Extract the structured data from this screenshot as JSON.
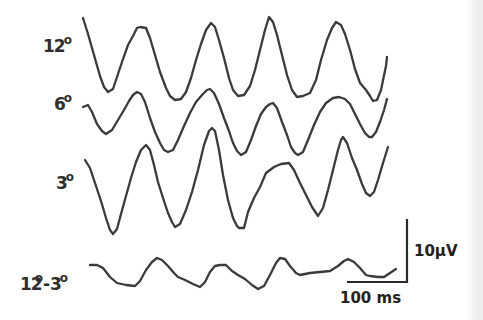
{
  "labels": {
    "trace_12": {
      "value": "12",
      "unit": "o"
    },
    "trace_6": {
      "value": "6",
      "unit": "o"
    },
    "trace_3": {
      "value": "3",
      "unit": "o"
    },
    "trace_diff": {
      "a": "12",
      "a_unit": "o",
      "sep": "-",
      "b": "3",
      "b_unit": "o"
    }
  },
  "scale_bar": {
    "amplitude_label": "10µV",
    "time_label": "100 ms"
  },
  "colors": {
    "trace": "#3a3a3a",
    "text": "#2e2e2e",
    "background": "#ffffff"
  },
  "chart_data": {
    "type": "line",
    "title": "",
    "xlabel": "",
    "ylabel": "",
    "scale": {
      "vertical": "10 µV",
      "horizontal": "100 ms"
    },
    "grid": false,
    "legend": "inline labels at left of each trace",
    "series": [
      {
        "name": "12°",
        "points": [
          [
            83,
            18
          ],
          [
            88,
            34
          ],
          [
            94,
            55
          ],
          [
            100,
            76
          ],
          [
            104,
            87
          ],
          [
            108,
            92
          ],
          [
            113,
            89
          ],
          [
            117,
            77
          ],
          [
            122,
            62
          ],
          [
            128,
            45
          ],
          [
            133,
            36
          ],
          [
            137,
            28
          ],
          [
            140,
            27
          ],
          [
            146,
            28
          ],
          [
            150,
            38
          ],
          [
            155,
            55
          ],
          [
            160,
            72
          ],
          [
            166,
            88
          ],
          [
            170,
            96
          ],
          [
            175,
            100
          ],
          [
            181,
            99
          ],
          [
            186,
            92
          ],
          [
            191,
            78
          ],
          [
            196,
            60
          ],
          [
            201,
            44
          ],
          [
            206,
            30
          ],
          [
            211,
            23
          ],
          [
            215,
            27
          ],
          [
            219,
            40
          ],
          [
            224,
            58
          ],
          [
            229,
            78
          ],
          [
            233,
            90
          ],
          [
            238,
            96
          ],
          [
            244,
            95
          ],
          [
            250,
            86
          ],
          [
            255,
            70
          ],
          [
            260,
            50
          ],
          [
            265,
            30
          ],
          [
            269,
            17
          ],
          [
            273,
            22
          ],
          [
            277,
            35
          ],
          [
            282,
            55
          ],
          [
            287,
            75
          ],
          [
            292,
            90
          ],
          [
            297,
            97
          ],
          [
            303,
            96
          ],
          [
            310,
            93
          ],
          [
            316,
            80
          ],
          [
            321,
            60
          ],
          [
            327,
            40
          ],
          [
            332,
            28
          ],
          [
            336,
            22
          ],
          [
            341,
            25
          ],
          [
            345,
            34
          ],
          [
            350,
            50
          ],
          [
            355,
            69
          ],
          [
            360,
            83
          ],
          [
            366,
            90
          ],
          [
            370,
            96
          ],
          [
            373,
            101
          ],
          [
            377,
            100
          ],
          [
            381,
            90
          ],
          [
            386,
            66
          ],
          [
            387,
            57
          ]
        ]
      },
      {
        "name": "6°",
        "points": [
          [
            83,
            107
          ],
          [
            88,
            105
          ],
          [
            92,
            112
          ],
          [
            97,
            124
          ],
          [
            102,
            131
          ],
          [
            106,
            134
          ],
          [
            112,
            130
          ],
          [
            118,
            120
          ],
          [
            124,
            110
          ],
          [
            129,
            101
          ],
          [
            133,
            95
          ],
          [
            137,
            92
          ],
          [
            141,
            94
          ],
          [
            145,
            102
          ],
          [
            150,
            118
          ],
          [
            155,
            132
          ],
          [
            160,
            143
          ],
          [
            164,
            150
          ],
          [
            168,
            152
          ],
          [
            173,
            150
          ],
          [
            178,
            140
          ],
          [
            184,
            126
          ],
          [
            190,
            113
          ],
          [
            196,
            102
          ],
          [
            202,
            95
          ],
          [
            207,
            90
          ],
          [
            210,
            89
          ],
          [
            214,
            93
          ],
          [
            219,
            104
          ],
          [
            224,
            118
          ],
          [
            229,
            131
          ],
          [
            233,
            143
          ],
          [
            237,
            151
          ],
          [
            241,
            155
          ],
          [
            246,
            152
          ],
          [
            251,
            140
          ],
          [
            256,
            126
          ],
          [
            261,
            114
          ],
          [
            266,
            107
          ],
          [
            270,
            104
          ],
          [
            273,
            103
          ],
          [
            277,
            108
          ],
          [
            282,
            122
          ],
          [
            287,
            135
          ],
          [
            291,
            147
          ],
          [
            295,
            153
          ],
          [
            298,
            155
          ],
          [
            303,
            152
          ],
          [
            308,
            140
          ],
          [
            314,
            125
          ],
          [
            320,
            112
          ],
          [
            326,
            103
          ],
          [
            333,
            98
          ],
          [
            339,
            97
          ],
          [
            345,
            99
          ],
          [
            350,
            104
          ],
          [
            355,
            114
          ],
          [
            360,
            124
          ],
          [
            365,
            133
          ],
          [
            369,
            137
          ],
          [
            372,
            137
          ],
          [
            376,
            132
          ],
          [
            380,
            122
          ],
          [
            384,
            110
          ],
          [
            387,
            99
          ]
        ]
      },
      {
        "name": "3°",
        "points": [
          [
            85,
            160
          ],
          [
            90,
            168
          ],
          [
            95,
            183
          ],
          [
            101,
            201
          ],
          [
            106,
            218
          ],
          [
            110,
            230
          ],
          [
            113,
            234
          ],
          [
            117,
            229
          ],
          [
            121,
            214
          ],
          [
            126,
            196
          ],
          [
            131,
            178
          ],
          [
            136,
            162
          ],
          [
            141,
            150
          ],
          [
            146,
            145
          ],
          [
            150,
            150
          ],
          [
            154,
            165
          ],
          [
            158,
            182
          ],
          [
            163,
            198
          ],
          [
            168,
            213
          ],
          [
            172,
            222
          ],
          [
            175,
            227
          ],
          [
            180,
            224
          ],
          [
            186,
            210
          ],
          [
            192,
            192
          ],
          [
            198,
            170
          ],
          [
            204,
            145
          ],
          [
            209,
            131
          ],
          [
            212,
            128
          ],
          [
            215,
            131
          ],
          [
            219,
            150
          ],
          [
            223,
            175
          ],
          [
            228,
            200
          ],
          [
            233,
            218
          ],
          [
            237,
            226
          ],
          [
            239,
            228
          ],
          [
            244,
            228
          ],
          [
            248,
            212
          ],
          [
            254,
            198
          ],
          [
            260,
            187
          ],
          [
            266,
            173
          ],
          [
            274,
            167
          ],
          [
            281,
            164
          ],
          [
            289,
            163
          ],
          [
            294,
            170
          ],
          [
            300,
            183
          ],
          [
            306,
            195
          ],
          [
            312,
            207
          ],
          [
            316,
            213
          ],
          [
            318,
            216
          ],
          [
            323,
            208
          ],
          [
            328,
            190
          ],
          [
            333,
            170
          ],
          [
            338,
            150
          ],
          [
            341,
            140
          ],
          [
            343,
            137
          ],
          [
            347,
            143
          ],
          [
            352,
            158
          ],
          [
            357,
            170
          ],
          [
            362,
            184
          ],
          [
            366,
            193
          ],
          [
            370,
            196
          ],
          [
            374,
            192
          ],
          [
            378,
            180
          ],
          [
            383,
            163
          ],
          [
            388,
            147
          ]
        ]
      },
      {
        "name": "12°-3°",
        "points": [
          [
            90,
            265
          ],
          [
            97,
            265
          ],
          [
            103,
            268
          ],
          [
            110,
            277
          ],
          [
            117,
            283
          ],
          [
            126,
            285
          ],
          [
            135,
            286
          ],
          [
            140,
            281
          ],
          [
            146,
            270
          ],
          [
            152,
            262
          ],
          [
            157,
            258
          ],
          [
            162,
            260
          ],
          [
            168,
            266
          ],
          [
            174,
            273
          ],
          [
            178,
            277
          ],
          [
            185,
            280
          ],
          [
            193,
            284
          ],
          [
            200,
            287
          ],
          [
            205,
            282
          ],
          [
            210,
            272
          ],
          [
            215,
            266
          ],
          [
            220,
            265
          ],
          [
            226,
            265
          ],
          [
            232,
            271
          ],
          [
            238,
            275
          ],
          [
            245,
            279
          ],
          [
            252,
            285
          ],
          [
            258,
            289
          ],
          [
            264,
            286
          ],
          [
            270,
            275
          ],
          [
            276,
            263
          ],
          [
            280,
            258
          ],
          [
            285,
            259
          ],
          [
            290,
            266
          ],
          [
            296,
            273
          ],
          [
            300,
            275
          ],
          [
            310,
            273
          ],
          [
            320,
            272
          ],
          [
            330,
            271
          ],
          [
            338,
            266
          ],
          [
            344,
            261
          ],
          [
            348,
            259
          ],
          [
            354,
            262
          ],
          [
            360,
            268
          ],
          [
            366,
            275
          ],
          [
            370,
            276
          ],
          [
            378,
            277
          ],
          [
            384,
            277
          ],
          [
            390,
            273
          ],
          [
            396,
            269
          ]
        ]
      }
    ]
  }
}
